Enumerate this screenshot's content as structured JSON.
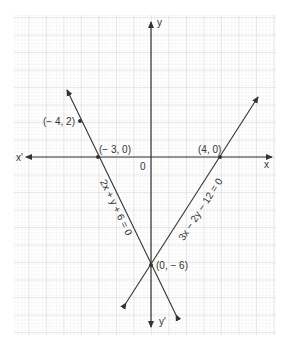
{
  "axes": {
    "x_pos_label": "x",
    "x_neg_label": "x'",
    "y_pos_label": "y",
    "y_neg_label": "y'",
    "origin_label": "0"
  },
  "points": [
    {
      "label": "(− 4, 2)",
      "x": -4,
      "y": 2
    },
    {
      "label": "(− 3, 0)",
      "x": -3,
      "y": 0
    },
    {
      "label": "(4, 0)",
      "x": 4,
      "y": 0
    },
    {
      "label": "(0, − 6)",
      "x": 0,
      "y": -6
    }
  ],
  "lines": [
    {
      "equation": "2x + y + 6 = 0",
      "passes_through": [
        "(-4, 2)",
        "(-3, 0)",
        "(0, -6)"
      ]
    },
    {
      "equation": "3x − 2y − 12 = 0",
      "passes_through": [
        "(4, 0)",
        "(0, -6)"
      ]
    }
  ],
  "colors": {
    "grid_minor": "#e3e3e3",
    "grid_major": "#cfcfcf",
    "line": "#333333"
  }
}
